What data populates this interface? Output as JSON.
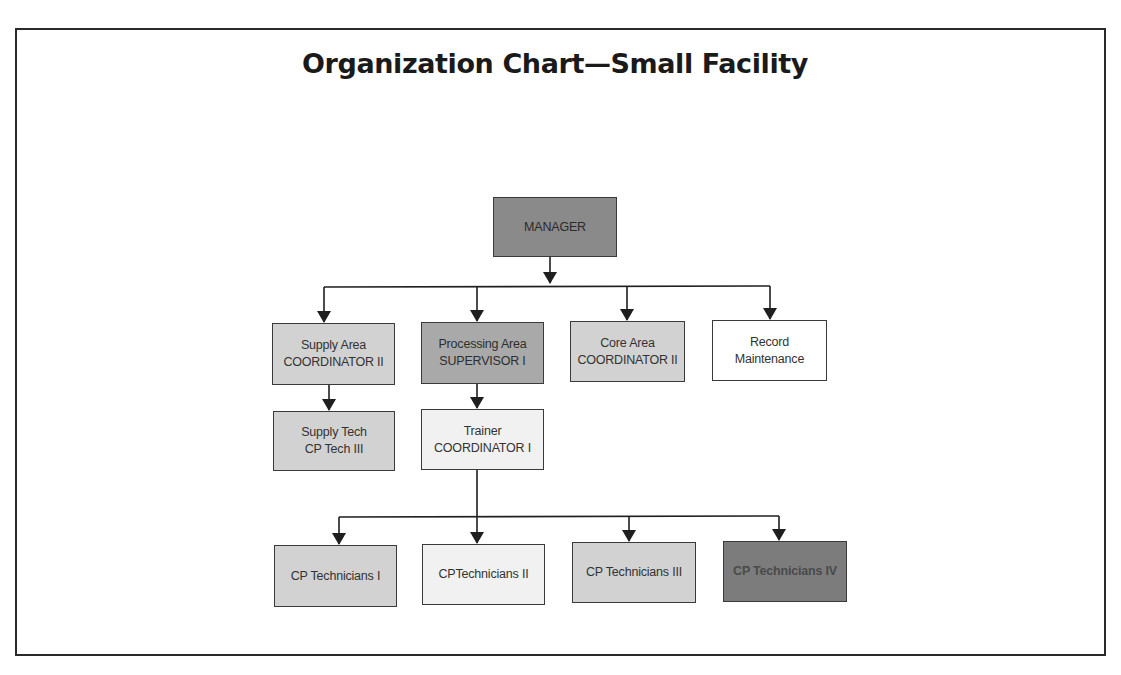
{
  "title": "Organization Chart—Small Facility",
  "colors": {
    "frame_border": "#2a2a2a",
    "connector": "#1f1f1f",
    "manager_fill": "#8a8a8a",
    "supervisor_fill": "#a9a9a9",
    "coordinator_fill": "#d2d2d2",
    "trainer_fill": "#f1f1f1",
    "record_fill": "#ffffff",
    "tech4_fill": "#7c7c7c"
  },
  "nodes": {
    "manager": {
      "line1": "MANAGER"
    },
    "supply_area": {
      "line1": "Supply Area",
      "line2": "COORDINATOR II"
    },
    "processing_area": {
      "line1": "Processing Area",
      "line2": "SUPERVISOR I"
    },
    "core_area": {
      "line1": "Core Area",
      "line2": "COORDINATOR II"
    },
    "record_maintenance": {
      "line1": "Record",
      "line2": "Maintenance"
    },
    "supply_tech": {
      "line1": "Supply Tech",
      "line2": "CP Tech III"
    },
    "trainer": {
      "line1": "Trainer",
      "line2": "COORDINATOR I"
    },
    "cp_tech_1": {
      "line1": "CP Technicians I"
    },
    "cp_tech_2": {
      "line1": "CPTechnicians II"
    },
    "cp_tech_3": {
      "line1": "CP Technicians III"
    },
    "cp_tech_4": {
      "line1": "CP Technicians IV"
    }
  },
  "hierarchy": [
    {
      "from": "manager",
      "to": [
        "supply_area",
        "processing_area",
        "core_area",
        "record_maintenance"
      ]
    },
    {
      "from": "supply_area",
      "to": [
        "supply_tech"
      ]
    },
    {
      "from": "processing_area",
      "to": [
        "trainer"
      ]
    },
    {
      "from": "trainer",
      "to": [
        "cp_tech_1",
        "cp_tech_2",
        "cp_tech_3",
        "cp_tech_4"
      ]
    }
  ]
}
